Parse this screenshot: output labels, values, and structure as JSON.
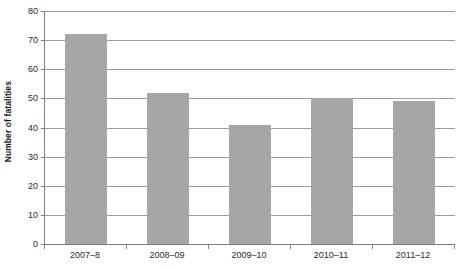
{
  "chart_data": {
    "type": "bar",
    "title": "",
    "subtitle": "",
    "xlabel": "",
    "ylabel": "Number of fatalities",
    "categories": [
      "2007–8",
      "2008–09",
      "2009–10",
      "2010–11",
      "2011–12"
    ],
    "values": [
      72,
      52,
      41,
      50,
      49
    ],
    "ylim": [
      0,
      80
    ],
    "ytick_values": [
      0,
      10,
      20,
      30,
      40,
      50,
      60,
      70,
      80
    ],
    "ytick_labels": [
      "0",
      "10",
      "20",
      "30",
      "40",
      "50",
      "60",
      "70",
      "80"
    ],
    "grid": true,
    "grid_axis": "y",
    "legend": false,
    "legend_position": "none",
    "series": [
      {
        "name": "Number of fatalities",
        "values": [
          72,
          52,
          41,
          50,
          49
        ]
      }
    ],
    "colors": {
      "bar_fill": "#a6a6a6",
      "gridline": "#9a9a9a",
      "axis_line": "#7a7a7a",
      "text": "#2b2b2b",
      "axis_title": "#1a1a1a",
      "background": "#ffffff"
    }
  }
}
